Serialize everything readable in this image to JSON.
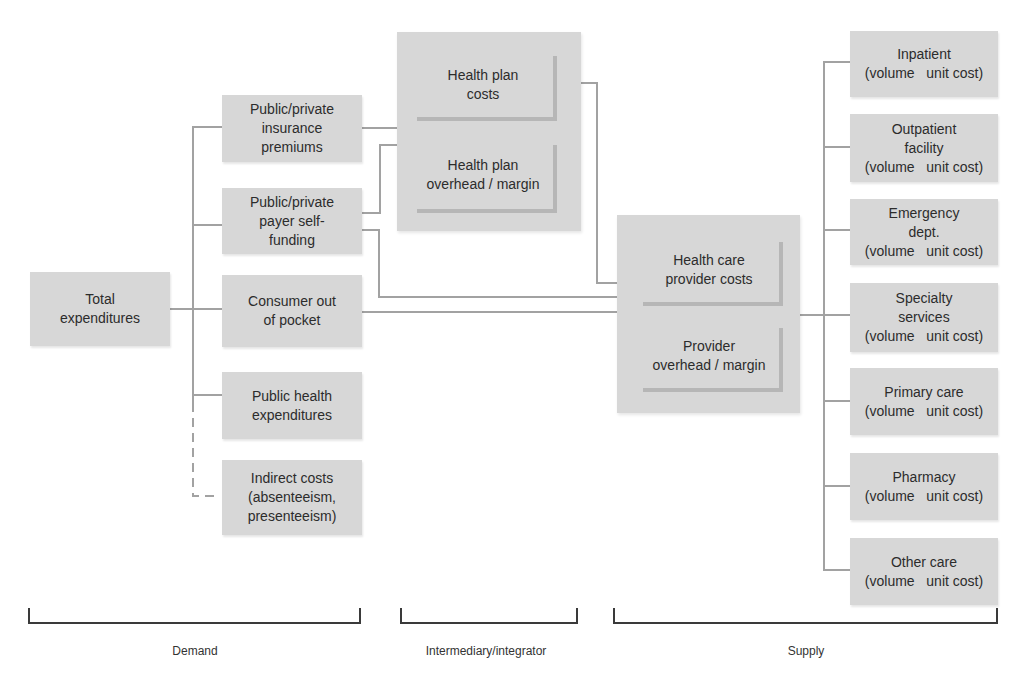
{
  "colors": {
    "box_fill": "#d7d7d7",
    "inner_shadow": "#b6b6b6",
    "connector_line": "#a2a2a2",
    "bracket": "#3a3a3a",
    "text": "#2c2c2c"
  },
  "demand": {
    "root": "Total\nexpenditures",
    "sources": [
      "Public/private\ninsurance\npremiums",
      "Public/private\npayer self-\nfunding",
      "Consumer out\nof pocket",
      "Public health\nexpenditures",
      "Indirect costs\n(absenteeism,\npresenteeism)"
    ]
  },
  "intermediary": {
    "items": [
      "Health plan\ncosts",
      "Health plan\noverhead / margin"
    ]
  },
  "provider": {
    "items": [
      "Health care\nprovider costs",
      "Provider\noverhead / margin"
    ]
  },
  "supply": {
    "items": [
      "Inpatient\n(volume   unit cost)",
      "Outpatient\nfacility\n(volume   unit cost)",
      "Emergency\ndept.\n(volume   unit cost)",
      "Specialty\nservices\n(volume   unit cost)",
      "Primary care\n(volume   unit cost)",
      "Pharmacy\n(volume   unit cost)",
      "Other care\n(volume   unit cost)"
    ]
  },
  "brackets": {
    "demand": "Demand",
    "intermediary": "Intermediary/integrator",
    "supply": "Supply"
  }
}
